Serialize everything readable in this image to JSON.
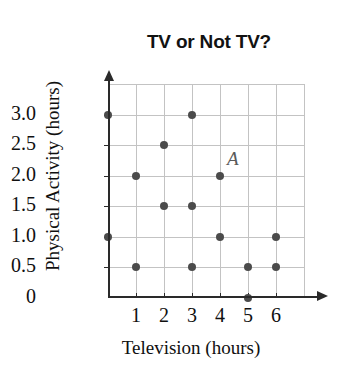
{
  "chart_data": {
    "type": "scatter",
    "title": "TV or Not TV?",
    "xlabel": "Television (hours)",
    "ylabel": "Physical Activity (hours)",
    "xlim": [
      0,
      7
    ],
    "ylim": [
      0,
      3.5
    ],
    "grid": true,
    "legend": "none",
    "x_ticks": [
      "1",
      "2",
      "3",
      "4",
      "5",
      "6"
    ],
    "x_tick_values": [
      1,
      2,
      3,
      4,
      5,
      6
    ],
    "y_ticks": [
      "0",
      "0.5",
      "1.0",
      "1.5",
      "2.0",
      "2.5",
      "3.0"
    ],
    "y_tick_values": [
      0,
      0.5,
      1.0,
      1.5,
      2.0,
      2.5,
      3.0
    ],
    "points": [
      {
        "x": 0,
        "y": 3.0
      },
      {
        "x": 3,
        "y": 3.0
      },
      {
        "x": 2,
        "y": 2.5
      },
      {
        "x": 1,
        "y": 2.0
      },
      {
        "x": 4,
        "y": 2.0
      },
      {
        "x": 2,
        "y": 1.5
      },
      {
        "x": 3,
        "y": 1.5
      },
      {
        "x": 0,
        "y": 1.0
      },
      {
        "x": 4,
        "y": 1.0
      },
      {
        "x": 6,
        "y": 1.0
      },
      {
        "x": 1,
        "y": 0.5
      },
      {
        "x": 3,
        "y": 0.5
      },
      {
        "x": 5,
        "y": 0.5
      },
      {
        "x": 6,
        "y": 0.5
      },
      {
        "x": 5,
        "y": 0
      }
    ],
    "annotations": [
      {
        "label": "A",
        "x": 4,
        "y": 2.0
      }
    ],
    "marker_color": "#4b4b4b",
    "grid_color": "#c3c3c3",
    "axis_color": "#2a2a2a"
  }
}
